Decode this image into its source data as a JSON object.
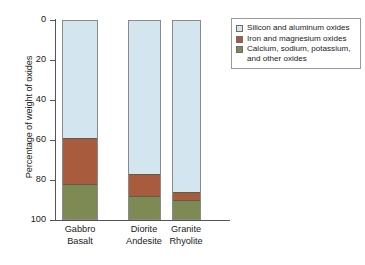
{
  "chart_data": {
    "type": "bar",
    "subtype": "stacked-bar",
    "title": "",
    "xlabel": "",
    "ylabel": "Percentage of weight of oxides",
    "ylim": [
      0,
      100
    ],
    "y_axis_inverted": true,
    "yticks": [
      0,
      20,
      40,
      60,
      80,
      100
    ],
    "ytick_labels": [
      "0",
      "20",
      "40",
      "60",
      "80",
      "100"
    ],
    "grid": false,
    "legend_position": "upper-right",
    "categories": [
      "Gabbro Basalt",
      "Diorite Andesite",
      "Granite Rhyolite"
    ],
    "category_lines": [
      [
        "Gabbro",
        "Basalt"
      ],
      [
        "Diorite",
        "Andesite"
      ],
      [
        "Granite",
        "Rhyolite"
      ]
    ],
    "series": [
      {
        "name": "Silicon and aluminum oxides",
        "color": "#d3e6ef",
        "values": [
          59,
          77,
          86
        ]
      },
      {
        "name": "Iron and magnesium oxides",
        "color": "#a85b3d",
        "values": [
          23,
          11,
          4
        ]
      },
      {
        "name": "Calcium, sodium, potassium, and other oxides",
        "color": "#7d8a54",
        "values": [
          18,
          12,
          10
        ]
      }
    ],
    "cumulative_boundaries": [
      [
        59,
        82
      ],
      [
        77,
        88
      ],
      [
        86,
        90
      ]
    ]
  },
  "legend": {
    "items": [
      {
        "label": "Silicon and aluminum oxides",
        "color": "#d3e6ef"
      },
      {
        "label": "Iron and magnesium oxides",
        "color": "#a85b3d"
      },
      {
        "label": "Calcium, sodium, potassium,\nand other oxides",
        "color": "#7d8a54"
      }
    ],
    "item_0_label": "Silicon and aluminum oxides",
    "item_1_label": "Iron and magnesium oxides",
    "item_2_label_line1": "Calcium, sodium, potassium,",
    "item_2_label_line2": "and other oxides"
  },
  "axis": {
    "y_title": "Percentage of weight of oxides",
    "ytick_0": "0",
    "ytick_1": "20",
    "ytick_2": "40",
    "ytick_3": "60",
    "ytick_4": "80",
    "ytick_5": "100"
  },
  "xlabels": {
    "bar0_line1": "Gabbro",
    "bar0_line2": "Basalt",
    "bar1_line1": "Diorite",
    "bar1_line2": "Andesite",
    "bar2_line1": "Granite",
    "bar2_line2": "Rhyolite"
  }
}
